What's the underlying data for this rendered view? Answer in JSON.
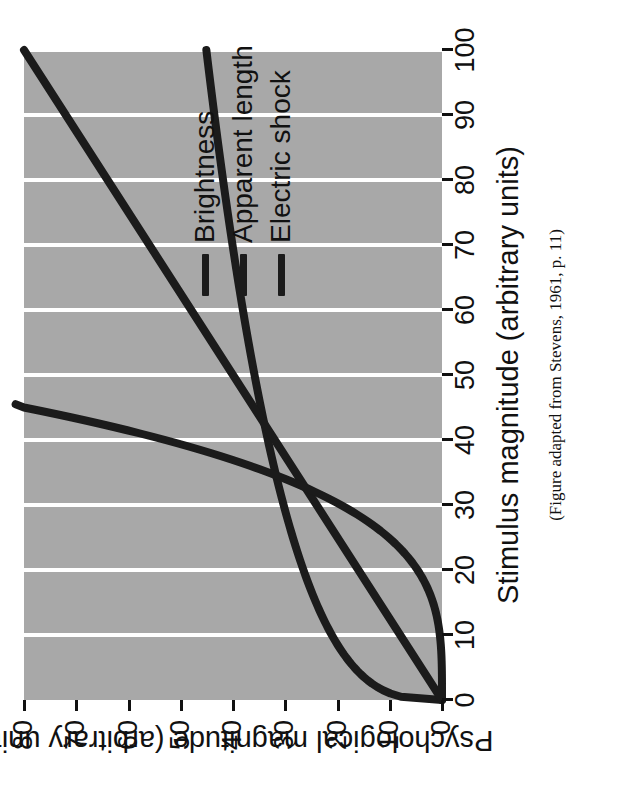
{
  "figure": {
    "caption": "(Figure adapted from Stevens, 1961, p. 11)",
    "background_color": "#a8a8a8",
    "line_color": "#1b1b1b",
    "gridline_color": "#ffffff"
  },
  "chart_data": {
    "type": "line",
    "title": "",
    "xlabel": "Stimulus magnitude (arbitrary units)",
    "ylabel": "Psychological magnitude (arbitrary units)",
    "xlim": [
      0,
      100
    ],
    "ylim": [
      0,
      80
    ],
    "xticks": [
      0,
      10,
      20,
      30,
      40,
      50,
      60,
      70,
      80,
      90,
      100
    ],
    "yticks": [
      0,
      10,
      20,
      30,
      40,
      50,
      60,
      70,
      80
    ],
    "xticklabels": [
      "0",
      "10",
      "20",
      "30",
      "40",
      "50",
      "60",
      "70",
      "80",
      "90",
      "100"
    ],
    "yticklabels": [
      "0",
      "10",
      "20",
      "30",
      "40",
      "50",
      "60",
      "70",
      "80"
    ],
    "grid": "vertical-gridlines-at-x-ticks",
    "legend_position": "inside-right",
    "x": [
      0,
      5,
      10,
      15,
      20,
      25,
      30,
      33,
      35,
      40,
      45,
      50,
      55,
      60,
      65,
      70,
      75,
      80,
      85,
      90,
      95,
      100
    ],
    "series": [
      {
        "name": "Brightness",
        "exponent": 0.33,
        "values": [
          0,
          17.0,
          21.4,
          24.5,
          26.9,
          29.0,
          30.8,
          31.8,
          32.4,
          33.9,
          35.2,
          36.4,
          37.5,
          38.6,
          39.5,
          40.4,
          41.3,
          42.1,
          42.9,
          43.7,
          44.4,
          45.1
        ]
      },
      {
        "name": "Apparent length",
        "exponent": 1.0,
        "values": [
          0,
          4.0,
          8.0,
          12.0,
          16.0,
          20.0,
          24.0,
          26.4,
          28.0,
          32.0,
          36.0,
          40.0,
          44.0,
          48.0,
          52.0,
          56.0,
          60.0,
          64.0,
          68.0,
          72.0,
          76.0,
          80.0
        ]
      },
      {
        "name": "Electric shock",
        "exponent": 3.5,
        "values": [
          0,
          0.4,
          2.0,
          5.7,
          12.0,
          21.2,
          33.6,
          42.5,
          49.2,
          68.5,
          80.0,
          null,
          null,
          null,
          null,
          null,
          null,
          null,
          null,
          null,
          null,
          null
        ]
      }
    ],
    "note": "All three curves intersect near (33, 33); electric shock exits the top of the plot near x=45."
  },
  "legend": {
    "items": [
      {
        "label": "Brightness"
      },
      {
        "label": "Apparent length"
      },
      {
        "label": "Electric shock"
      }
    ]
  }
}
